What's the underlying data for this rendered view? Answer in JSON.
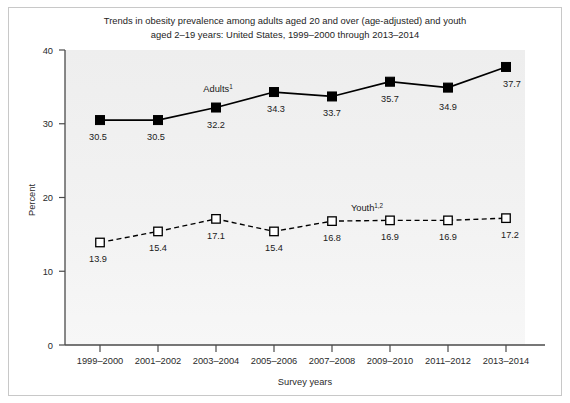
{
  "chart_data": {
    "type": "line",
    "title": "Trends in obesity prevalence among adults aged 20 and over (age-adjusted) and youth aged 2–19 years: United States, 1999–2000 through 2013–2014",
    "title_line1": "Trends in obesity prevalence among adults aged 20 and over (age-adjusted) and youth",
    "title_line2": "aged 2–19 years: United States, 1999–2000 through 2013–2014",
    "xlabel": "Survey years",
    "ylabel": "Percent",
    "ylim": [
      0,
      40
    ],
    "yticks": [
      "0",
      "10",
      "20",
      "30",
      "40"
    ],
    "ytick_values": [
      0,
      10,
      20,
      30,
      40
    ],
    "grid": false,
    "legend_position": "inline-annotation",
    "categories": [
      "1999–2000",
      "2001–2002",
      "2003–2004",
      "2005–2006",
      "2007–2008",
      "2009–2010",
      "2011–2012",
      "2013–2014"
    ],
    "series": [
      {
        "name": "Adults",
        "annotation": "Adults",
        "annotation_sup": "1",
        "marker": "filled-square",
        "line_style": "solid",
        "color": "#000000",
        "values": [
          30.5,
          30.5,
          32.2,
          34.3,
          33.7,
          35.7,
          34.9,
          37.7
        ],
        "labels": [
          "30.5",
          "30.5",
          "32.2",
          "34.3",
          "33.7",
          "35.7",
          "34.9",
          "37.7"
        ]
      },
      {
        "name": "Youth",
        "annotation": "Youth",
        "annotation_sup": "1,2",
        "marker": "open-square",
        "line_style": "dashed",
        "color": "#000000",
        "values": [
          13.9,
          15.4,
          17.1,
          15.4,
          16.8,
          16.9,
          16.9,
          17.2
        ],
        "labels": [
          "13.9",
          "15.4",
          "17.1",
          "15.4",
          "16.8",
          "16.9",
          "16.9",
          "17.2"
        ]
      }
    ]
  },
  "style": {
    "plot_background": "#f1f1f1",
    "axis_color": "#4a4a4a",
    "frame_color": "#c8c8c8",
    "text_color": "#1d1d1d"
  }
}
